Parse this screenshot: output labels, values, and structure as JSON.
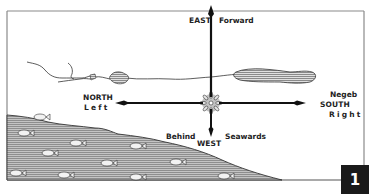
{
  "figure": {
    "number": "1"
  },
  "compass": {
    "east": {
      "direction": "EAST",
      "meaning": "Forward"
    },
    "north": {
      "direction": "NORTH",
      "meaning": "Left"
    },
    "south": {
      "direction": "SOUTH",
      "meaning": "Right",
      "region": "Negeb"
    },
    "west": {
      "direction": "WEST",
      "meaning_left": "Behind",
      "meaning_right": "Seawards"
    }
  },
  "colors": {
    "ink": "#1f1f1f",
    "frame": "#8a8a8a",
    "sea": "#a9a9a9",
    "lake": "#b5b5b5",
    "fish": "#f2f2f2",
    "badge_bg": "#1a1a1a",
    "badge_fg": "#ffffff"
  }
}
